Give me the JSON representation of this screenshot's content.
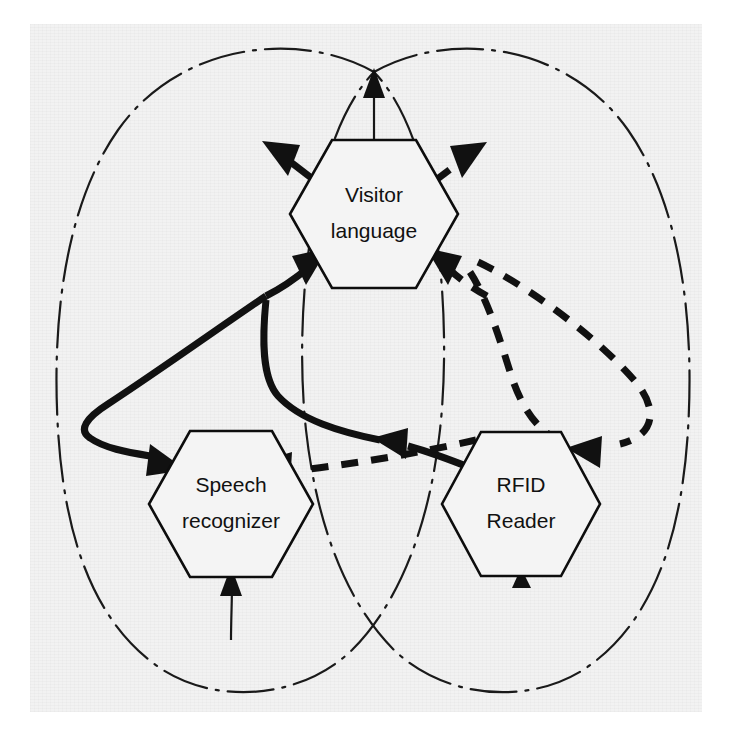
{
  "figure": {
    "background_color": "#f2f2f2",
    "ink_color": "#111111",
    "width": 737,
    "height": 741
  },
  "nodes": [
    {
      "id": "visitor-language",
      "shape": "hexagon",
      "line1": "Visitor",
      "line2": "language",
      "cx": 374,
      "cy": 214,
      "rx": 84,
      "ry": 74
    },
    {
      "id": "speech-recognizer",
      "shape": "hexagon",
      "line1": "Speech",
      "line2": "recognizer",
      "cx": 231,
      "cy": 504,
      "rx": 82,
      "ry": 73
    },
    {
      "id": "rfid-reader",
      "shape": "hexagon",
      "line1": "RFID",
      "line2": "Reader",
      "cx": 521,
      "cy": 504,
      "rx": 79,
      "ry": 72
    }
  ],
  "edges": [
    {
      "id": "visitor-out-upleft",
      "style": "solid",
      "from": "visitor-language",
      "to": "boundary-left",
      "arrow": "up-left"
    },
    {
      "id": "visitor-out-upright",
      "style": "dashed",
      "from": "visitor-language",
      "to": "boundary-right",
      "arrow": "up-right"
    },
    {
      "id": "visitor-in-lowleft",
      "style": "solid",
      "from": "speech-recognizer",
      "to": "visitor-language",
      "arrow": "up-right"
    },
    {
      "id": "visitor-in-lowright",
      "style": "dashed",
      "from": "rfid-reader",
      "to": "visitor-language",
      "arrow": "up-left"
    },
    {
      "id": "loop-left-to-speech",
      "style": "solid",
      "from": "visitor-language",
      "to": "speech-recognizer",
      "arrow": "down-left"
    },
    {
      "id": "solid-to-rfid-area",
      "style": "solid",
      "from": "rfid-reader",
      "to": "visitor-language",
      "arrow": "left"
    },
    {
      "id": "dashed-rfid-to-speech",
      "style": "dashed",
      "from": "rfid-reader",
      "to": "speech-recognizer",
      "arrow": "left"
    },
    {
      "id": "loop-right-to-rfid",
      "style": "dashed",
      "from": "visitor-language",
      "to": "rfid-reader",
      "arrow": "left"
    },
    {
      "id": "external-in-speech",
      "style": "thin",
      "from": "outside",
      "to": "speech-recognizer",
      "arrow": "up"
    },
    {
      "id": "external-out-visitor-top",
      "style": "thin",
      "from": "visitor-language",
      "to": "boundary-top",
      "arrow": "up"
    },
    {
      "id": "rfid-bottom-tick",
      "style": "thin",
      "from": "outside",
      "to": "rfid-reader",
      "arrow": "up"
    }
  ],
  "boundaries": [
    {
      "id": "boundary-left-lobe",
      "style": "dash-dot",
      "label": ""
    },
    {
      "id": "boundary-right-lobe",
      "style": "dash-dot",
      "label": ""
    }
  ]
}
